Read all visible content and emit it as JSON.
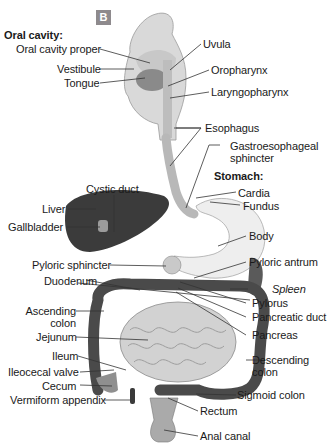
{
  "figure": {
    "panel_badge": "B",
    "colors": {
      "badge_bg": "#8e8a8d",
      "organ_light": "#e6e6e6",
      "organ_mid": "#b9b9b9",
      "organ_dark": "#3a3a3a",
      "leader": "#333333"
    }
  },
  "labels_left": {
    "oral_cavity_heading": "Oral cavity:",
    "oral_cavity_proper": "Oral cavity proper",
    "vestibule": "Vestibule",
    "tongue": "Tongue",
    "cystic_duct": "Cystic duct",
    "liver": "Liver",
    "gallbladder": "Gallbladder",
    "pyloric_sphincter": "Pyloric sphincter",
    "duodenum": "Duodenum",
    "ascending_colon_1": "Ascending",
    "ascending_colon_2": "colon",
    "jejunum": "Jejunum",
    "ileum": "Ileum",
    "ileocecal_valve": "Ileocecal valve",
    "cecum": "Cecum",
    "vermiform_appendix": "Vermiform appendix"
  },
  "labels_right": {
    "uvula": "Uvula",
    "oropharynx": "Oropharynx",
    "laryngopharynx": "Laryngopharynx",
    "esophagus": "Esophagus",
    "gastroesophageal_1": "Gastroesophageal",
    "gastroesophageal_2": "sphincter",
    "stomach_heading": "Stomach:",
    "cardia": "Cardia",
    "fundus": "Fundus",
    "body": "Body",
    "pyloric_antrum": "Pyloric antrum",
    "spleen": "Spleen",
    "pylorus": "Pylorus",
    "pancreatic_duct": "Pancreatic duct",
    "pancreas": "Pancreas",
    "descending_colon_1": "Descending",
    "descending_colon_2": "colon",
    "sigmoid_colon": "Sigmoid colon",
    "rectum": "Rectum",
    "anal_canal": "Anal canal"
  }
}
